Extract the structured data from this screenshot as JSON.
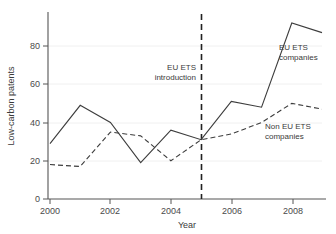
{
  "chart_data": {
    "type": "line",
    "title": "",
    "xlabel": "Year",
    "ylabel": "Low-carbon patents",
    "x": [
      2000,
      2001,
      2002,
      2003,
      2004,
      2005,
      2006,
      2007,
      2008,
      2009
    ],
    "xlim": [
      2000,
      2009
    ],
    "ylim": [
      0,
      95
    ],
    "xticks": [
      2000,
      2002,
      2004,
      2006,
      2008
    ],
    "xtick_labels": [
      "2000",
      "2002",
      "2004",
      "2006",
      "2008"
    ],
    "yticks": [
      0,
      20,
      40,
      60,
      80
    ],
    "ytick_labels": [
      "0",
      "20",
      "40",
      "60",
      "80"
    ],
    "grid": true,
    "legend_position": "inline-annotations",
    "series": [
      {
        "name": "EU ETS companies",
        "style": "solid",
        "color": "#3d3d3d",
        "values": [
          29,
          49,
          40,
          19,
          36,
          31,
          51,
          48,
          92,
          87
        ]
      },
      {
        "name": "Non EU ETS companies",
        "style": "dashed",
        "color": "#3d3d3d",
        "values": [
          18,
          17,
          35,
          33,
          20,
          31,
          34,
          40,
          50,
          47
        ]
      }
    ],
    "annotations": [
      {
        "id": "eu-ets-introduction",
        "line1": "EU ETS",
        "line2": "introduction",
        "x": 2005,
        "type": "vertical-event-line"
      },
      {
        "id": "eu-ets-companies",
        "line1": "EU ETS",
        "line2": "companies",
        "type": "series-label"
      },
      {
        "id": "non-eu-ets-companies",
        "line1": "Non EU ETS",
        "line2": "companies",
        "type": "series-label"
      }
    ]
  }
}
